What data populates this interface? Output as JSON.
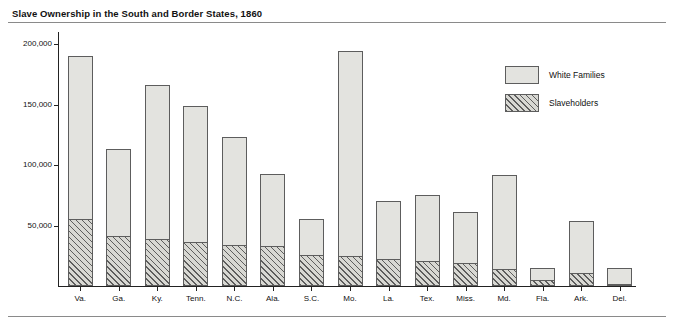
{
  "chart_data": {
    "type": "bar",
    "title": "Slave Ownership in the South and Border States, 1860",
    "xlabel": "",
    "ylabel": "",
    "ylim": [
      0,
      210000
    ],
    "grid": false,
    "legend_position": "top-right",
    "stacked": true,
    "categories": [
      "Va.",
      "Ga.",
      "Ky.",
      "Tenn.",
      "N.C.",
      "Ala.",
      "S.C.",
      "Mo.",
      "La.",
      "Tex.",
      "Miss.",
      "Md.",
      "Fla.",
      "Ark.",
      "Del."
    ],
    "yticks": [
      50000,
      100000,
      150000,
      200000
    ],
    "ytick_labels": [
      "50,000",
      "100,000",
      "150,000",
      "200,000"
    ],
    "series": [
      {
        "name": "White Families",
        "values": [
          190000,
          113000,
          166000,
          149000,
          123000,
          93000,
          55000,
          194000,
          70000,
          75000,
          61000,
          92000,
          15000,
          54000,
          15000
        ]
      },
      {
        "name": "Slaveholders",
        "values": [
          55000,
          41000,
          39000,
          36000,
          34000,
          33000,
          26000,
          25000,
          22000,
          21000,
          19000,
          14000,
          5000,
          11000,
          1500
        ]
      }
    ]
  },
  "legend": {
    "items": [
      {
        "label": "White Families",
        "swatch": "solid-gray"
      },
      {
        "label": "Slaveholders",
        "swatch": "hatched"
      }
    ]
  },
  "colors": {
    "bar_fill": "#e3e3df",
    "bar_stroke": "#5d5d5d",
    "axis": "#222222",
    "rule": "#8a8a8a",
    "text": "#111111"
  }
}
